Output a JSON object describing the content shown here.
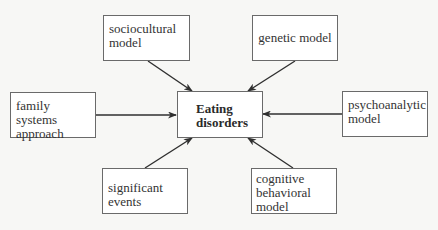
{
  "diagram": {
    "type": "hub-and-spoke",
    "center": {
      "label": "Eating\ndisorders"
    },
    "nodes": [
      {
        "id": "sociocultural",
        "label": "sociocultural\nmodel"
      },
      {
        "id": "genetic",
        "label": "genetic model"
      },
      {
        "id": "family",
        "label": "family systems\napproach"
      },
      {
        "id": "psychoanalytic",
        "label": "psychoanalytic\nmodel"
      },
      {
        "id": "significant",
        "label": "significant\nevents"
      },
      {
        "id": "cognitive",
        "label": "cognitive\nbehavioral\nmodel"
      }
    ],
    "edges": [
      {
        "from": "sociocultural",
        "to": "center"
      },
      {
        "from": "genetic",
        "to": "center"
      },
      {
        "from": "family",
        "to": "center"
      },
      {
        "from": "psychoanalytic",
        "to": "center"
      },
      {
        "from": "significant",
        "to": "center"
      },
      {
        "from": "cognitive",
        "to": "center"
      }
    ]
  },
  "colors": {
    "background": "#f7f7f5",
    "box_fill": "#ffffff",
    "box_border": "#6a6a6a",
    "arrow": "#2f2f2f",
    "text": "#333333"
  }
}
